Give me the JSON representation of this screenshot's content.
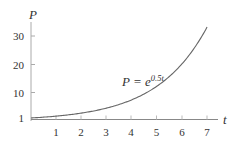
{
  "chart_data": {
    "type": "line",
    "title": "",
    "xlabel": "t",
    "ylabel": "P",
    "annotation": {
      "text_base": "P = e",
      "text_exp": "0.5t",
      "x": 3.6,
      "y": 12.5
    },
    "function": "P = e^(0.5t)",
    "xlim": [
      0,
      7.4
    ],
    "ylim": [
      0,
      34
    ],
    "x_ticks": [
      1,
      2,
      3,
      4,
      5,
      6,
      7
    ],
    "y_ticks": [
      1,
      10,
      20,
      30
    ],
    "grid": false,
    "legend": null,
    "series": [
      {
        "name": "P = e^{0.5t}",
        "color": "#666666",
        "x": [
          0,
          0.5,
          1,
          1.5,
          2,
          2.5,
          3,
          3.5,
          4,
          4.5,
          5,
          5.5,
          6,
          6.5,
          7
        ],
        "values": [
          1.0,
          1.28,
          1.65,
          2.12,
          2.72,
          3.49,
          4.48,
          5.75,
          7.39,
          9.49,
          12.18,
          15.64,
          20.09,
          25.79,
          33.12
        ]
      }
    ]
  },
  "labels": {
    "y_axis": "P",
    "x_axis": "t",
    "eq_base": "P = e",
    "eq_exp": "0.5t",
    "x_tick_labels": [
      "1",
      "2",
      "3",
      "4",
      "5",
      "6",
      "7"
    ],
    "y_tick_labels": [
      "1",
      "10",
      "20",
      "30"
    ]
  }
}
